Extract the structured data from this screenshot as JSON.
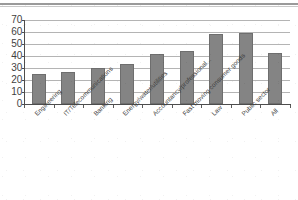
{
  "figure": {
    "has_top_rule": true,
    "background_color": "#ffffff"
  },
  "chart_data": {
    "type": "bar",
    "title": "",
    "subtitle": "",
    "xlabel": "",
    "ylabel": "",
    "ylim": [
      0,
      70
    ],
    "ytick_step": 10,
    "yticks": [
      70,
      60,
      50,
      40,
      30,
      20,
      10,
      0
    ],
    "ytick_labels": [
      "70",
      "60",
      "50",
      "40",
      "30",
      "20",
      "10",
      "0"
    ],
    "grid": true,
    "grid_axis": "y",
    "legend": false,
    "legend_position": "none",
    "bar_color": "#848484",
    "bar_edge_color": "#6e6e6e",
    "axis_color": "#4d4d4d",
    "gridline_color": "#b4b4b4",
    "label_rotation": -45,
    "categories": [
      "Engineering",
      "IT/Telecommunications",
      "Banking",
      "Energy/water/utilities",
      "Accountancy/professional...",
      "Fast moving consumer goods",
      "Law",
      "Public sector",
      "All"
    ],
    "values": [
      25,
      26.5,
      30,
      33,
      41.5,
      44,
      58,
      59,
      42.5
    ]
  }
}
